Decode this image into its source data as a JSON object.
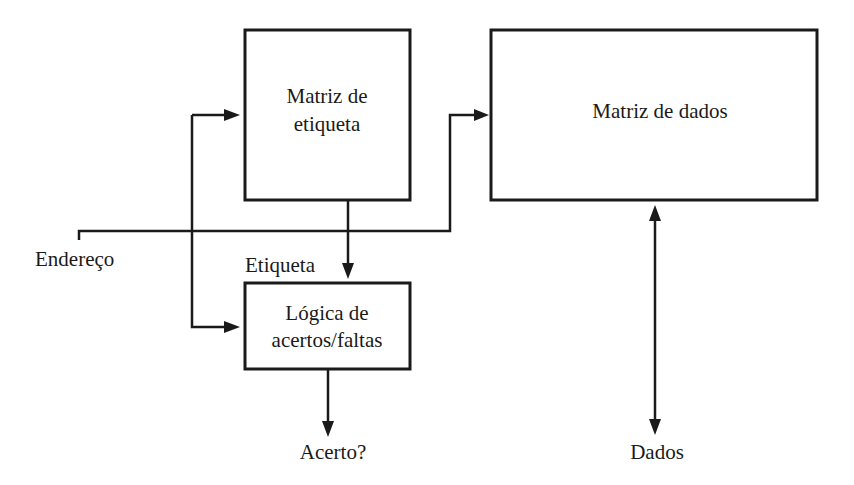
{
  "diagram": {
    "blocks": {
      "tag_array": {
        "line1": "Matriz de",
        "line2": "etiqueta"
      },
      "data_array": {
        "label": "Matriz de dados"
      },
      "hit_miss_logic": {
        "line1": "Lógica de",
        "line2": "acertos/faltas"
      }
    },
    "labels": {
      "address": "Endereço",
      "tag": "Etiqueta",
      "hit": "Acerto?",
      "data": "Dados"
    },
    "connections": [
      {
        "from": "address",
        "to": "tag_array",
        "direction": "one-way"
      },
      {
        "from": "address",
        "to": "data_array",
        "direction": "one-way"
      },
      {
        "from": "address",
        "to": "hit_miss_logic",
        "direction": "one-way"
      },
      {
        "from": "tag_array",
        "to": "hit_miss_logic",
        "label": "Etiqueta",
        "direction": "one-way"
      },
      {
        "from": "hit_miss_logic",
        "to": "hit",
        "direction": "one-way"
      },
      {
        "from": "data_array",
        "to": "data",
        "direction": "bidirectional"
      }
    ]
  }
}
